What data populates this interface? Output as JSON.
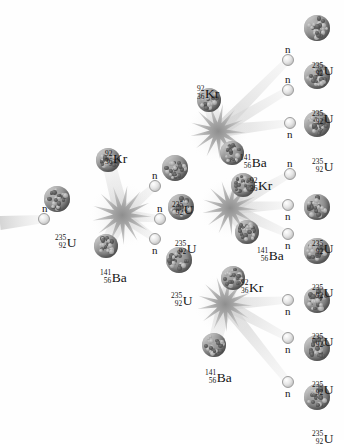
{
  "diagram": {
    "background": "#ffffff",
    "width": 344,
    "height": 440,
    "colors": {
      "nucleus_dark": "#5e5e5e",
      "nucleus_light": "#b9b9b9",
      "neutron": "#e6e6e6",
      "trail": "#d8d8d8",
      "burst": "#bdbdbd",
      "text": "#141414"
    }
  },
  "species": {
    "uranium": {
      "mass": "235",
      "atomic": "92",
      "symbol": "U"
    },
    "krypton": {
      "mass": "92",
      "atomic": "36",
      "symbol": "Kr"
    },
    "barium": {
      "mass": "141",
      "atomic": "56",
      "symbol": "Ba"
    },
    "neutron": {
      "symbol": "n"
    }
  },
  "labels": {
    "u235": {
      "mass": "235",
      "atomic": "92",
      "symbol": "U"
    },
    "kr92": {
      "mass": "92",
      "atomic": "36",
      "symbol": "Kr"
    },
    "ba141": {
      "mass": "141",
      "atomic": "56",
      "symbol": "Ba"
    },
    "n": "n"
  },
  "nuclei": [
    {
      "id": "u-gen0",
      "kind": "uranium",
      "x": 57,
      "y": 199,
      "r": 13,
      "label_x": 55,
      "label_y": 227,
      "label": "u235"
    },
    {
      "id": "kr-gen1",
      "kind": "krypton",
      "x": 108,
      "y": 160,
      "r": 12,
      "label_x": 105,
      "label_y": 143,
      "label": "kr92"
    },
    {
      "id": "ba-gen1",
      "kind": "barium",
      "x": 106,
      "y": 246,
      "r": 12,
      "label_x": 100,
      "label_y": 262,
      "label": "ba141"
    },
    {
      "id": "u-t1",
      "kind": "uranium",
      "x": 175,
      "y": 168,
      "r": 13,
      "label_x": 172,
      "label_y": 194,
      "label": "u235"
    },
    {
      "id": "u-t2",
      "kind": "uranium",
      "x": 181,
      "y": 207,
      "r": 13,
      "label_x": 175,
      "label_y": 233,
      "label": "u235"
    },
    {
      "id": "u-t3",
      "kind": "uranium",
      "x": 179,
      "y": 260,
      "r": 13,
      "label_x": 171,
      "label_y": 285,
      "label": "u235"
    },
    {
      "id": "kr-gen2a",
      "kind": "krypton",
      "x": 209,
      "y": 100,
      "r": 12,
      "label_x": 197,
      "label_y": 78,
      "label": "kr92"
    },
    {
      "id": "ba-gen2a",
      "kind": "barium",
      "x": 232,
      "y": 153,
      "r": 12,
      "label_x": 240,
      "label_y": 147,
      "label": "ba141"
    },
    {
      "id": "kr-gen2b",
      "kind": "krypton",
      "x": 243,
      "y": 185,
      "r": 12,
      "label_x": 250,
      "label_y": 170,
      "label": "kr92"
    },
    {
      "id": "ba-gen2b",
      "kind": "barium",
      "x": 247,
      "y": 232,
      "r": 12,
      "label_x": 257,
      "label_y": 240,
      "label": "ba141"
    },
    {
      "id": "kr-gen2c",
      "kind": "krypton",
      "x": 233,
      "y": 278,
      "r": 12,
      "label_x": 241,
      "label_y": 272,
      "label": "kr92"
    },
    {
      "id": "ba-gen2c",
      "kind": "barium",
      "x": 214,
      "y": 345,
      "r": 12,
      "label_x": 205,
      "label_y": 362,
      "label": "ba141"
    },
    {
      "id": "u-r1",
      "kind": "uranium",
      "x": 317,
      "y": 28,
      "r": 13,
      "label_x": 312,
      "label_y": 55,
      "label": "u235"
    },
    {
      "id": "u-r2",
      "kind": "uranium",
      "x": 317,
      "y": 76,
      "r": 13,
      "label_x": 312,
      "label_y": 103,
      "label": "u235"
    },
    {
      "id": "u-r3",
      "kind": "uranium",
      "x": 317,
      "y": 124,
      "r": 13,
      "label_x": 312,
      "label_y": 151,
      "label": "u235"
    },
    {
      "id": "u-r4",
      "kind": "uranium",
      "x": 317,
      "y": 207,
      "r": 13,
      "label_x": 312,
      "label_y": 233,
      "label": "u235"
    },
    {
      "id": "u-r5",
      "kind": "uranium",
      "x": 317,
      "y": 251,
      "r": 13,
      "label_x": 312,
      "label_y": 277,
      "label": "u235"
    },
    {
      "id": "u-r6",
      "kind": "uranium",
      "x": 317,
      "y": 300,
      "r": 13,
      "label_x": 312,
      "label_y": 326,
      "label": "u235"
    },
    {
      "id": "u-r7",
      "kind": "uranium",
      "x": 317,
      "y": 348,
      "r": 13,
      "label_x": 312,
      "label_y": 374,
      "label": "u235"
    },
    {
      "id": "u-r8",
      "kind": "uranium",
      "x": 317,
      "y": 397,
      "r": 13,
      "label_x": 312,
      "label_y": 423,
      "label": "u235"
    }
  ],
  "neutrons": [
    {
      "id": "n-in",
      "x": 44,
      "y": 219,
      "r": 6,
      "label_x": 42,
      "label_y": 203
    },
    {
      "id": "n-g1a",
      "x": 155,
      "y": 186,
      "r": 6,
      "label_x": 152,
      "label_y": 170
    },
    {
      "id": "n-g1b",
      "x": 160,
      "y": 219,
      "r": 6,
      "label_x": 157,
      "label_y": 203
    },
    {
      "id": "n-g1c",
      "x": 155,
      "y": 239,
      "r": 6,
      "label_x": 152,
      "label_y": 245
    },
    {
      "id": "n-g2a",
      "x": 288,
      "y": 60,
      "r": 6,
      "label_x": 285,
      "label_y": 44
    },
    {
      "id": "n-g2b",
      "x": 288,
      "y": 90,
      "r": 6,
      "label_x": 285,
      "label_y": 74
    },
    {
      "id": "n-g2c",
      "x": 290,
      "y": 123,
      "r": 6,
      "label_x": 287,
      "label_y": 129
    },
    {
      "id": "n-g3a",
      "x": 290,
      "y": 174,
      "r": 6,
      "label_x": 287,
      "label_y": 158
    },
    {
      "id": "n-g3b",
      "x": 288,
      "y": 205,
      "r": 6,
      "label_x": 285,
      "label_y": 211
    },
    {
      "id": "n-g3c",
      "x": 288,
      "y": 234,
      "r": 6,
      "label_x": 285,
      "label_y": 240
    },
    {
      "id": "n-g4a",
      "x": 288,
      "y": 300,
      "r": 6,
      "label_x": 285,
      "label_y": 306
    },
    {
      "id": "n-g4b",
      "x": 288,
      "y": 338,
      "r": 6,
      "label_x": 285,
      "label_y": 344
    },
    {
      "id": "n-g4c",
      "x": 288,
      "y": 382,
      "r": 6,
      "label_x": 285,
      "label_y": 388
    }
  ],
  "bursts": [
    {
      "id": "burst-gen1",
      "x": 122,
      "y": 215,
      "r": 30
    },
    {
      "id": "burst-gen2a",
      "x": 218,
      "y": 131,
      "r": 28
    },
    {
      "id": "burst-gen2b",
      "x": 230,
      "y": 208,
      "r": 28
    },
    {
      "id": "burst-gen2c",
      "x": 225,
      "y": 304,
      "r": 28
    }
  ],
  "trails": [
    {
      "id": "trail-incoming",
      "x1": 0,
      "y1": 223,
      "x2": 44,
      "y2": 219,
      "w1": 14,
      "w2": 8
    },
    {
      "id": "trail-kr1",
      "x1": 122,
      "y1": 215,
      "x2": 108,
      "y2": 160,
      "w1": 16,
      "w2": 13
    },
    {
      "id": "trail-ba1",
      "x1": 122,
      "y1": 215,
      "x2": 106,
      "y2": 246,
      "w1": 16,
      "w2": 13
    },
    {
      "id": "trail-n1a",
      "x1": 122,
      "y1": 215,
      "x2": 155,
      "y2": 186,
      "w1": 12,
      "w2": 7
    },
    {
      "id": "trail-n1b",
      "x1": 122,
      "y1": 215,
      "x2": 160,
      "y2": 219,
      "w1": 12,
      "w2": 7
    },
    {
      "id": "trail-n1c",
      "x1": 122,
      "y1": 215,
      "x2": 155,
      "y2": 239,
      "w1": 12,
      "w2": 7
    },
    {
      "id": "trail-kr2a",
      "x1": 218,
      "y1": 131,
      "x2": 209,
      "y2": 100,
      "w1": 15,
      "w2": 13
    },
    {
      "id": "trail-ba2a",
      "x1": 218,
      "y1": 131,
      "x2": 232,
      "y2": 153,
      "w1": 15,
      "w2": 13
    },
    {
      "id": "trail-n2a",
      "x1": 218,
      "y1": 131,
      "x2": 288,
      "y2": 60,
      "w1": 13,
      "w2": 7
    },
    {
      "id": "trail-n2b",
      "x1": 218,
      "y1": 131,
      "x2": 288,
      "y2": 90,
      "w1": 13,
      "w2": 7
    },
    {
      "id": "trail-n2c",
      "x1": 218,
      "y1": 131,
      "x2": 290,
      "y2": 123,
      "w1": 13,
      "w2": 7
    },
    {
      "id": "trail-kr3a",
      "x1": 230,
      "y1": 208,
      "x2": 243,
      "y2": 185,
      "w1": 15,
      "w2": 13
    },
    {
      "id": "trail-ba3a",
      "x1": 230,
      "y1": 208,
      "x2": 247,
      "y2": 232,
      "w1": 15,
      "w2": 13
    },
    {
      "id": "trail-n3a",
      "x1": 230,
      "y1": 208,
      "x2": 290,
      "y2": 174,
      "w1": 13,
      "w2": 7
    },
    {
      "id": "trail-n3b",
      "x1": 230,
      "y1": 208,
      "x2": 288,
      "y2": 205,
      "w1": 13,
      "w2": 7
    },
    {
      "id": "trail-n3c",
      "x1": 230,
      "y1": 208,
      "x2": 288,
      "y2": 234,
      "w1": 13,
      "w2": 7
    },
    {
      "id": "trail-kr4a",
      "x1": 225,
      "y1": 304,
      "x2": 233,
      "y2": 278,
      "w1": 15,
      "w2": 13
    },
    {
      "id": "trail-ba4a",
      "x1": 225,
      "y1": 304,
      "x2": 214,
      "y2": 345,
      "w1": 15,
      "w2": 13
    },
    {
      "id": "trail-n4a",
      "x1": 225,
      "y1": 304,
      "x2": 288,
      "y2": 300,
      "w1": 13,
      "w2": 7
    },
    {
      "id": "trail-n4b",
      "x1": 225,
      "y1": 304,
      "x2": 288,
      "y2": 338,
      "w1": 13,
      "w2": 7
    },
    {
      "id": "trail-n4c",
      "x1": 225,
      "y1": 304,
      "x2": 288,
      "y2": 382,
      "w1": 13,
      "w2": 7
    }
  ]
}
